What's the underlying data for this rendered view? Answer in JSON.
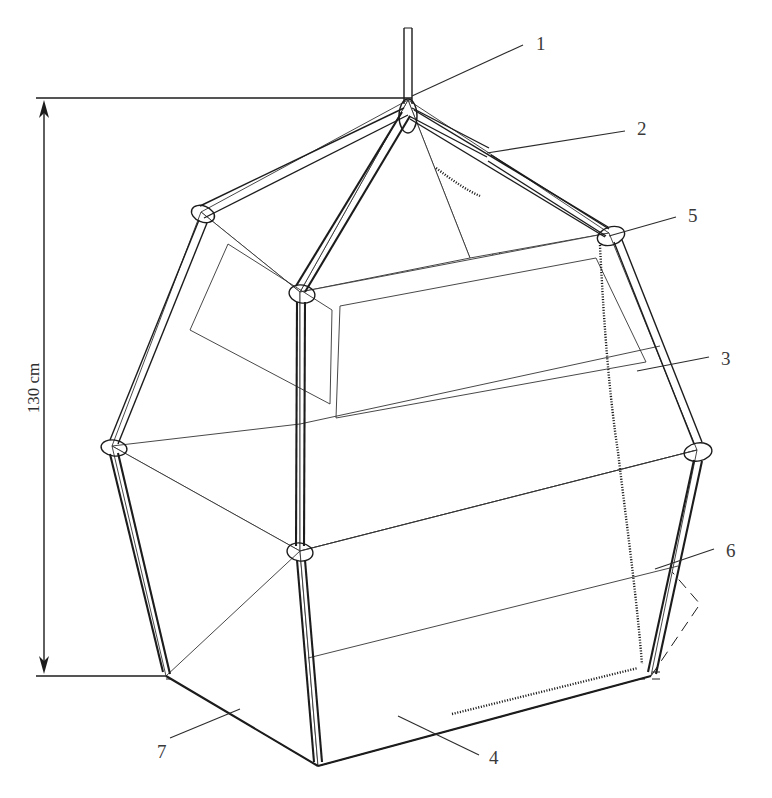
{
  "figure": {
    "type": "technical-line-drawing",
    "background_color": "#ffffff",
    "line_color": "#1c1c1c",
    "label_color": "#3a3a3a"
  },
  "dimension": {
    "label": "130 cm",
    "orientation": "vertical",
    "arrow_top_y": 98,
    "arrow_bottom_y": 676
  },
  "callouts": [
    {
      "id": "1",
      "label": "1",
      "x": 536,
      "y": 34,
      "leader_from": [
        412,
        96
      ],
      "leader_to": [
        523,
        45
      ],
      "target": "suspension-rod"
    },
    {
      "id": "2",
      "label": "2",
      "x": 637,
      "y": 119,
      "leader_from": [
        487,
        153
      ],
      "leader_to": [
        625,
        131
      ],
      "target": "roof-rib-pole"
    },
    {
      "id": "3",
      "label": "3",
      "x": 721,
      "y": 349,
      "leader_from": [
        637,
        371
      ],
      "leader_to": [
        709,
        357
      ],
      "target": "side-wall-panel"
    },
    {
      "id": "4",
      "label": "4",
      "x": 489,
      "y": 748,
      "leader_from": [
        398,
        716
      ],
      "leader_to": [
        479,
        755
      ],
      "target": "floor-seam"
    },
    {
      "id": "5",
      "label": "5",
      "x": 688,
      "y": 206,
      "leader_from": [
        609,
        236
      ],
      "leader_to": [
        676,
        217
      ],
      "target": "corner-joint-ring"
    },
    {
      "id": "6",
      "label": "6",
      "x": 726,
      "y": 541,
      "leader_from": [
        655,
        569
      ],
      "leader_to": [
        714,
        549
      ],
      "target": "inner-dashed-volume"
    },
    {
      "id": "7",
      "label": "7",
      "x": 157,
      "y": 742,
      "leader_from": [
        240,
        709
      ],
      "leader_to": [
        170,
        738
      ],
      "target": "ground-floor-sheet"
    }
  ],
  "geometry": {
    "apex": [
      408,
      100
    ],
    "rod_top": [
      408,
      28
    ],
    "shoulder_vertices": [
      [
        201,
        212
      ],
      [
        300,
        292
      ],
      [
        489,
        153
      ],
      [
        609,
        233
      ]
    ],
    "waist_vertices": [
      [
        112,
        446
      ],
      [
        300,
        551
      ],
      [
        697,
        450
      ]
    ],
    "base_vertices": [
      [
        166,
        676
      ],
      [
        318,
        766
      ],
      [
        651,
        676
      ]
    ]
  },
  "features": {
    "joint_rings": 6,
    "window_panels": 2,
    "zipper_seams": 2,
    "inner_box_style": "dashed",
    "ground_plane_style": "dashed"
  }
}
